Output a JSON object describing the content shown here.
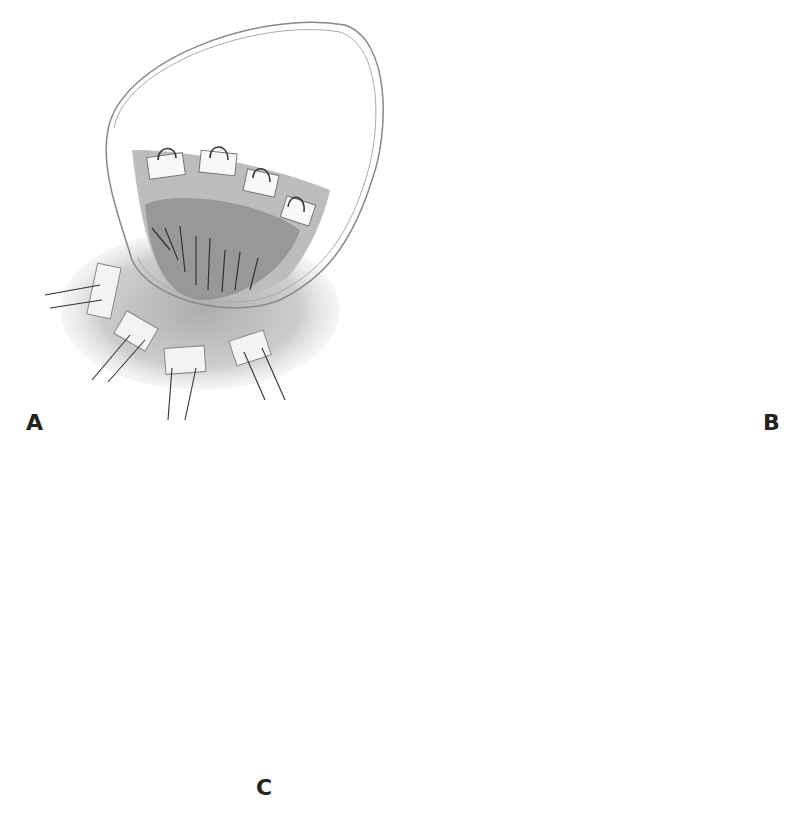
{
  "figure": {
    "panels": [
      {
        "id": "A",
        "label": "A",
        "description": "Open chamber with interrupted pledgeted mattress sutures placed along rim, sutures passed outward"
      },
      {
        "id": "B",
        "label": "B",
        "description": "Close-up of pledgets along tissue edge with paired suture strands"
      },
      {
        "id": "C",
        "label": "C",
        "description": "Completed running suture line closing oval opening"
      }
    ],
    "colors": {
      "background": "#ffffff",
      "line": "#555555",
      "shade": "#9a9a9a",
      "label": "#222222"
    }
  }
}
